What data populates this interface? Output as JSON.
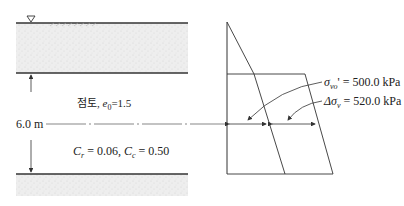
{
  "figure": {
    "soil_profile": {
      "water_table_symbol": "▽",
      "layer_label": "점토, e0=1.5",
      "layer_label_prefix": "점토,",
      "e0_symbol": "e",
      "e0_sub": "0",
      "e0_value": "=1.5",
      "thickness_label": "6.0 m",
      "cr_symbol": "C",
      "cr_sub": "r",
      "cr_value": "= 0.06,",
      "cc_symbol": "C",
      "cc_sub": "c",
      "cc_value": "= 0.50"
    },
    "stress_diagram": {
      "sigma_label_symbol": "σ",
      "sigma_label_sub": "vo",
      "sigma_label_value": "' = 500.0 kPa",
      "delta_label_symbol": "Δσ",
      "delta_label_sub": "v",
      "delta_label_value": "= 520.0 kPa"
    }
  }
}
